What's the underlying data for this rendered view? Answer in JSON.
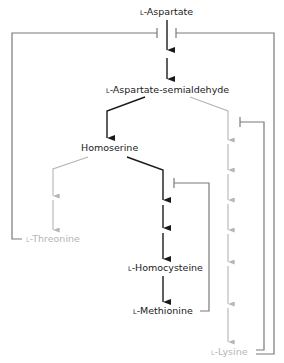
{
  "colors": {
    "main_path": "#1a1a1a",
    "minor_path": "#b5b5b5",
    "feedback": "#7a7a7a"
  },
  "nodes": {
    "aspartate": {
      "prefix": "L",
      "name": "-Aspartate"
    },
    "semialdehyde": {
      "prefix": "L",
      "name": "-Aspartate-semialdehyde"
    },
    "homoserine": {
      "prefix": "",
      "name": "Homoserine"
    },
    "threonine": {
      "prefix": "L",
      "name": "-Threonine"
    },
    "homocysteine": {
      "prefix": "L",
      "name": "-Homocysteine"
    },
    "methionine": {
      "prefix": "L",
      "name": "-Methionine"
    },
    "lysine": {
      "prefix": "L",
      "name": "-Lysine"
    }
  },
  "edges": [
    {
      "from": "L-Aspartate",
      "to": "L-Aspartate-semialdehyde",
      "steps": 2,
      "style": "main"
    },
    {
      "from": "L-Aspartate-semialdehyde",
      "to": "Homoserine",
      "steps": 1,
      "style": "main"
    },
    {
      "from": "L-Aspartate-semialdehyde",
      "to": "L-Lysine",
      "steps": 7,
      "style": "minor"
    },
    {
      "from": "Homoserine",
      "to": "L-Threonine",
      "steps": 2,
      "style": "minor"
    },
    {
      "from": "Homoserine",
      "to": "L-Homocysteine",
      "steps": 3,
      "style": "main"
    },
    {
      "from": "L-Homocysteine",
      "to": "L-Methionine",
      "steps": 1,
      "style": "main"
    }
  ],
  "inhibitions": [
    {
      "inhibitor": "L-Threonine",
      "target": "L-Aspartate step 1"
    },
    {
      "inhibitor": "L-Lysine",
      "target": "L-Aspartate step 1"
    },
    {
      "inhibitor": "L-Lysine",
      "target": "Lysine branch step 1"
    },
    {
      "inhibitor": "L-Methionine",
      "target": "Homoserine to Homocysteine step 1"
    }
  ]
}
